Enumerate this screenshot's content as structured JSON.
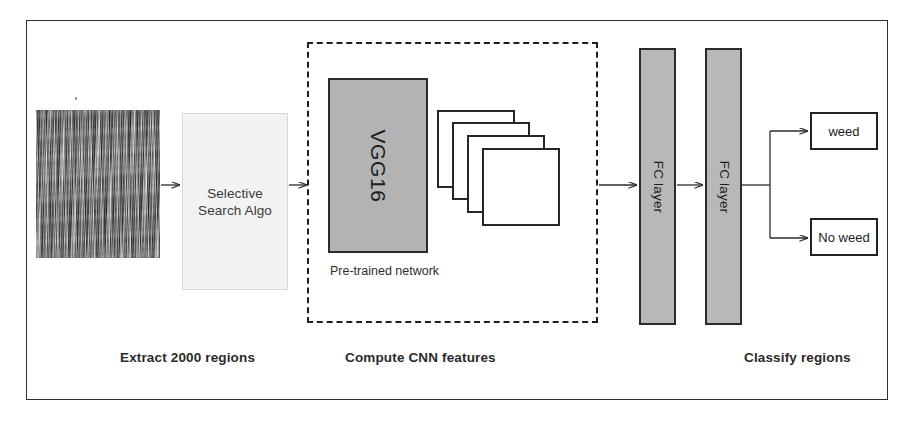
{
  "diagram": {
    "frame_color": "#2f2f2f",
    "background": "#ffffff"
  },
  "stages": {
    "extract": {
      "caption": "Extract  2000 regions",
      "input_image_name": "grass field aerial photo",
      "box_label_line1": "Selective",
      "box_label_line2": "Search Algo",
      "box_fill": "#f2f2f2"
    },
    "cnn": {
      "caption": "Compute CNN features",
      "network_label": "VGG16",
      "network_fill": "#b3b3b3",
      "sublabel": "Pre-trained network",
      "feature_map_count": 4
    },
    "classify": {
      "caption": "Classify regions",
      "fc_layer_1_label": "FC layer",
      "fc_layer_2_label": "FC layer",
      "fc_fill": "#b8b8b8",
      "outputs": [
        {
          "label": "weed"
        },
        {
          "label": "No weed"
        }
      ]
    }
  },
  "connectors": [
    {
      "name": "image-to-selective-search",
      "from": "field-image",
      "to": "ss-box"
    },
    {
      "name": "selective-search-to-cnn",
      "from": "ss-box",
      "to": "dashed-box"
    },
    {
      "name": "cnn-to-fc1",
      "from": "dashed-box",
      "to": "fc-bar-1"
    },
    {
      "name": "fc1-to-fc2",
      "from": "fc-bar-1",
      "to": "fc-bar-2"
    },
    {
      "name": "fc2-to-weed",
      "from": "fc-bar-2",
      "to": "weed"
    },
    {
      "name": "fc2-to-no-weed",
      "from": "fc-bar-2",
      "to": "no-weed"
    }
  ]
}
